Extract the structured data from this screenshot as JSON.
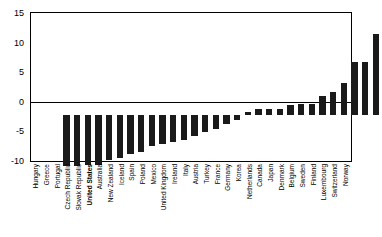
{
  "chart_data": {
    "type": "bar",
    "title": "",
    "subtitle": "",
    "xlabel": "",
    "ylabel": "",
    "ylim": [
      -10,
      15
    ],
    "yticks": [
      -10,
      -5,
      0,
      5,
      10,
      15
    ],
    "ytick_labels": [
      "-10",
      "-5",
      "0",
      "5",
      "10",
      "15"
    ],
    "grid": false,
    "legend": "none",
    "bar_color": "#1a1a1a",
    "highlight_category": "United States",
    "categories": [
      "Hungary",
      "Greece",
      "Portugal",
      "Czech Republic",
      "Slovak Republic",
      "United States",
      "Australia",
      "New Zealand",
      "Iceland",
      "Spain",
      "Poland",
      "Mexico",
      "United Kingdom",
      "Ireland",
      "Italy",
      "Austria",
      "Turkey",
      "France",
      "Germany",
      "Korea",
      "Netherlands",
      "Canada",
      "Japan",
      "Denmark",
      "Belgium",
      "Sweden",
      "Finland",
      "Luxembourg",
      "Switzerland",
      "Norway"
    ],
    "values": [
      -8.6,
      -8.6,
      -8.5,
      -8.4,
      -7.6,
      -7.3,
      -6.6,
      -6.2,
      -5.2,
      -4.9,
      -4.6,
      -4.2,
      -3.6,
      -2.9,
      -2.4,
      -1.6,
      -0.9,
      0.5,
      0.9,
      1.0,
      1.0,
      1.6,
      1.8,
      1.8,
      3.1,
      3.9,
      5.3,
      9.0,
      9.0,
      13.6
    ]
  }
}
